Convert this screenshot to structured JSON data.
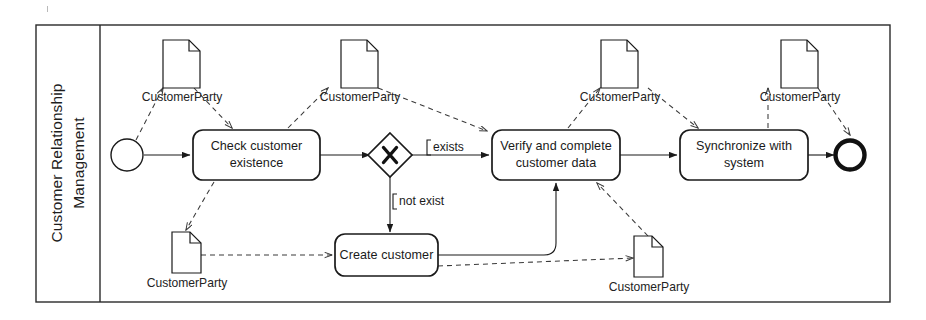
{
  "diagram": {
    "type": "bpmn-process-diagram",
    "pool": {
      "lane_label_lines": [
        "Customer Relationship",
        "Management"
      ],
      "lane_label": "Customer Relationship Management"
    },
    "colors": {
      "stroke": "#1a1a1a",
      "fill": "#ffffff",
      "dashed_stroke": "#3a3a3a",
      "text": "#1a1a1a",
      "frame": "#2a2a2a"
    },
    "events": [
      {
        "id": "start",
        "kind": "start-event",
        "label": ""
      },
      {
        "id": "end",
        "kind": "end-event",
        "label": ""
      }
    ],
    "gateway": {
      "id": "gw-exists",
      "kind": "exclusive-gateway",
      "marker": "X"
    },
    "tasks": [
      {
        "id": "task-check",
        "lines": [
          "Check customer",
          "existence"
        ],
        "label": "Check customer existence"
      },
      {
        "id": "task-verify",
        "lines": [
          "Verify and complete",
          "customer data"
        ],
        "label": "Verify and complete customer data"
      },
      {
        "id": "task-sync",
        "lines": [
          "Synchronize with",
          "system"
        ],
        "label": "Synchronize with system"
      },
      {
        "id": "task-create",
        "lines": [
          "Create customer"
        ],
        "label": "Create customer"
      }
    ],
    "data_objects": [
      {
        "id": "do-1",
        "label": "CustomerParty"
      },
      {
        "id": "do-2",
        "label": "CustomerParty"
      },
      {
        "id": "do-3",
        "label": "CustomerParty"
      },
      {
        "id": "do-4",
        "label": "CustomerParty"
      },
      {
        "id": "do-5",
        "label": "CustomerParty"
      },
      {
        "id": "do-6",
        "label": "CustomerParty"
      }
    ],
    "flow_labels": [
      {
        "id": "cond-exists",
        "label": "exists",
        "bracket": "["
      },
      {
        "id": "cond-not-exist",
        "label": "not exist",
        "bracket": "["
      }
    ]
  }
}
